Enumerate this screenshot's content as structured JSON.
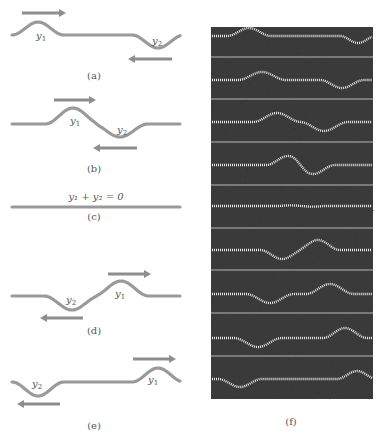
{
  "figure": {
    "colors": {
      "string": "#9a9a9a",
      "arrow": "#8e8e8e",
      "label": "#555555",
      "photo_bg": "#3a3a3a",
      "photo_wave": "#e8e8e8",
      "photo_rule": "#cfcfcf"
    },
    "panels": [
      {
        "id": "a",
        "label": "(a)",
        "label_pos": [
          94,
          78
        ],
        "string_y": 35,
        "pulses": [
          {
            "name": "y1",
            "center_x": 38,
            "amplitude": -13,
            "width": 26
          },
          {
            "name": "y2",
            "center_x": 158,
            "amplitude": 13,
            "width": 26
          }
        ],
        "symbols": [
          {
            "text": "y",
            "sub": "1",
            "x": 36,
            "y": 39
          },
          {
            "text": "y",
            "sub": "2",
            "x": 152,
            "y": 44
          }
        ],
        "arrows": [
          {
            "direction": "right",
            "x1": 22,
            "x2": 66,
            "y": 13
          },
          {
            "direction": "left",
            "x1": 172,
            "x2": 128,
            "y": 59
          }
        ],
        "x_start": 12,
        "x_end": 180
      },
      {
        "id": "b",
        "label": "(b)",
        "label_pos": [
          94,
          171
        ],
        "string_y": 124,
        "pulses": [
          {
            "name": "y1",
            "center_x": 73,
            "amplitude": -16,
            "width": 28
          },
          {
            "name": "y2",
            "center_x": 120,
            "amplitude": 13,
            "width": 28
          }
        ],
        "symbols": [
          {
            "text": "y",
            "sub": "1",
            "x": 70,
            "y": 124
          },
          {
            "text": "y",
            "sub": "2",
            "x": 117,
            "y": 133
          }
        ],
        "arrows": [
          {
            "direction": "right",
            "x1": 54,
            "x2": 96,
            "y": 100
          },
          {
            "direction": "left",
            "x1": 137,
            "x2": 93,
            "y": 148
          }
        ],
        "x_start": 12,
        "x_end": 180
      },
      {
        "id": "c",
        "label": "(c)",
        "label_pos": [
          94,
          219
        ],
        "string_y": 207,
        "pulses": [],
        "symbols": [],
        "equation": {
          "text": "y₁ + y₂ = 0",
          "x": 96,
          "y": 200
        },
        "arrows": [],
        "x_start": 12,
        "x_end": 180
      },
      {
        "id": "d",
        "label": "(d)",
        "label_pos": [
          94,
          333
        ],
        "string_y": 296,
        "pulses": [
          {
            "name": "y2",
            "center_x": 72,
            "amplitude": 14,
            "width": 28
          },
          {
            "name": "y1",
            "center_x": 121,
            "amplitude": -15,
            "width": 28
          }
        ],
        "symbols": [
          {
            "text": "y",
            "sub": "2",
            "x": 66,
            "y": 303
          },
          {
            "text": "y",
            "sub": "1",
            "x": 115,
            "y": 297
          }
        ],
        "arrows": [
          {
            "direction": "right",
            "x1": 108,
            "x2": 151,
            "y": 274
          },
          {
            "direction": "left",
            "x1": 83,
            "x2": 40,
            "y": 318
          }
        ],
        "x_start": 12,
        "x_end": 180
      },
      {
        "id": "e",
        "label": "(e)",
        "label_pos": [
          94,
          428
        ],
        "string_y": 382,
        "pulses": [
          {
            "name": "y2",
            "center_x": 38,
            "amplitude": 14,
            "width": 26
          },
          {
            "name": "y1",
            "center_x": 158,
            "amplitude": -14,
            "width": 26
          }
        ],
        "symbols": [
          {
            "text": "y",
            "sub": "2",
            "x": 32,
            "y": 387
          },
          {
            "text": "y",
            "sub": "1",
            "x": 148,
            "y": 383
          }
        ],
        "arrows": [
          {
            "direction": "right",
            "x1": 133,
            "x2": 176,
            "y": 359
          },
          {
            "direction": "left",
            "x1": 60,
            "x2": 17,
            "y": 404
          }
        ],
        "x_start": 12,
        "x_end": 180
      }
    ],
    "photo": {
      "label": "(f)",
      "label_pos": [
        291,
        424
      ],
      "x": 211,
      "y": 27,
      "width": 162,
      "height": 372,
      "rules_y": [
        57,
        99,
        142,
        185,
        228,
        270,
        313,
        356
      ],
      "frames": [
        {
          "base_y": 36,
          "pulses": [
            {
              "cx": 249,
              "amp": -8,
              "w": 22
            },
            {
              "cx": 358,
              "amp": 7,
              "w": 18
            }
          ]
        },
        {
          "base_y": 80,
          "pulses": [
            {
              "cx": 262,
              "amp": -8,
              "w": 24
            },
            {
              "cx": 342,
              "amp": 8,
              "w": 22
            }
          ]
        },
        {
          "base_y": 122,
          "pulses": [
            {
              "cx": 277,
              "amp": -9,
              "w": 24
            },
            {
              "cx": 324,
              "amp": 9,
              "w": 24
            }
          ]
        },
        {
          "base_y": 165,
          "pulses": [
            {
              "cx": 288,
              "amp": -9,
              "w": 22
            },
            {
              "cx": 313,
              "amp": 9,
              "w": 22
            }
          ]
        },
        {
          "base_y": 206,
          "pulses": [
            {
              "cx": 300,
              "amp": -3,
              "w": 22
            },
            {
              "cx": 303,
              "amp": 3,
              "w": 22
            }
          ]
        },
        {
          "base_y": 250,
          "pulses": [
            {
              "cx": 282,
              "amp": 9,
              "w": 22
            },
            {
              "cx": 318,
              "amp": -10,
              "w": 22
            }
          ]
        },
        {
          "base_y": 294,
          "pulses": [
            {
              "cx": 270,
              "amp": 9,
              "w": 24
            },
            {
              "cx": 330,
              "amp": -10,
              "w": 24
            }
          ]
        },
        {
          "base_y": 338,
          "pulses": [
            {
              "cx": 258,
              "amp": 9,
              "w": 24
            },
            {
              "cx": 345,
              "amp": -10,
              "w": 22
            }
          ]
        },
        {
          "base_y": 379,
          "pulses": [
            {
              "cx": 240,
              "amp": 8,
              "w": 22
            },
            {
              "cx": 357,
              "amp": -8,
              "w": 20
            }
          ]
        }
      ]
    }
  }
}
